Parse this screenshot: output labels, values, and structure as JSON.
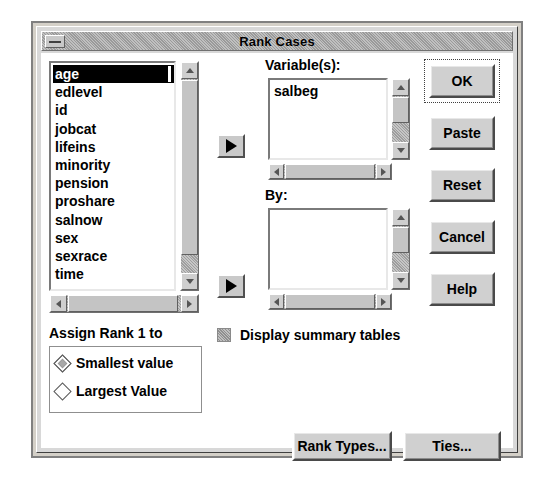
{
  "window": {
    "title": "Rank Cases",
    "sysmenu_icon": "window-menu-icon"
  },
  "source_list": {
    "name": "source-variable-list",
    "items": [
      {
        "label": "age",
        "selected": true
      },
      {
        "label": "edlevel",
        "selected": false
      },
      {
        "label": "id",
        "selected": false
      },
      {
        "label": "jobcat",
        "selected": false
      },
      {
        "label": "lifeins",
        "selected": false
      },
      {
        "label": "minority",
        "selected": false
      },
      {
        "label": "pension",
        "selected": false
      },
      {
        "label": "proshare",
        "selected": false
      },
      {
        "label": "salnow",
        "selected": false
      },
      {
        "label": "sex",
        "selected": false
      },
      {
        "label": "sexrace",
        "selected": false
      },
      {
        "label": "time",
        "selected": false
      }
    ]
  },
  "variables_panel": {
    "label": "Variable(s):",
    "items": [
      {
        "label": "salbeg"
      }
    ],
    "transfer_button_icon": "arrow-right-icon"
  },
  "by_panel": {
    "label": "By:",
    "items": [],
    "transfer_button_icon": "arrow-right-icon"
  },
  "action_buttons": [
    {
      "label": "OK",
      "name": "ok-button",
      "focused": true
    },
    {
      "label": "Paste",
      "name": "paste-button",
      "focused": false
    },
    {
      "label": "Reset",
      "name": "reset-button",
      "focused": false
    },
    {
      "label": "Cancel",
      "name": "cancel-button",
      "focused": false
    },
    {
      "label": "Help",
      "name": "help-button",
      "focused": false
    }
  ],
  "assign_rank": {
    "label": "Assign Rank 1 to",
    "options": [
      {
        "label": "Smallest value",
        "checked": true
      },
      {
        "label": "Largest Value",
        "checked": false
      }
    ]
  },
  "display_summary": {
    "label": "Display summary tables",
    "checked": false
  },
  "bottom_buttons": [
    {
      "label": "Rank Types...",
      "name": "rank-types-button"
    },
    {
      "label": "Ties...",
      "name": "ties-button"
    }
  ],
  "colors": {
    "dialog_background": "#d8d8d8",
    "face": "#d0d0d0",
    "list_background": "#ffffff",
    "selection_background": "#000000",
    "selection_text": "#ffffff",
    "text": "#000000"
  }
}
